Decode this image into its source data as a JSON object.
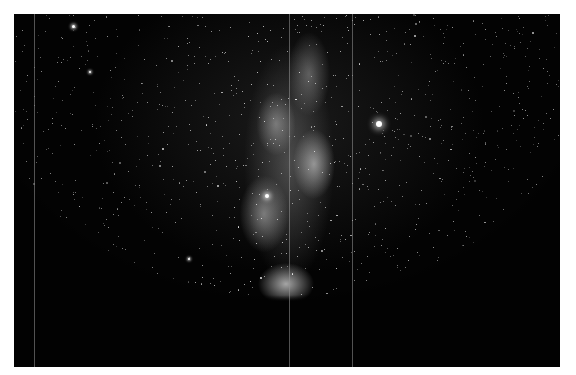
{
  "image": {
    "subject": "Milky Way night sky photograph",
    "colors": {
      "border": "#ffffff",
      "sky": "#030303",
      "galaxy_core": "#dcdcdc",
      "streak": "#969696"
    },
    "streaks_x": [
      20,
      275,
      338
    ],
    "bright_stars": [
      {
        "x": 365,
        "y": 110,
        "r": 3
      },
      {
        "x": 59,
        "y": 12,
        "r": 1.5
      },
      {
        "x": 76,
        "y": 58,
        "r": 1.2
      },
      {
        "x": 253,
        "y": 182,
        "r": 2
      },
      {
        "x": 175,
        "y": 245,
        "r": 1.2
      },
      {
        "x": 480,
        "y": 235,
        "r": 1.2
      },
      {
        "x": 150,
        "y": 290,
        "r": 1
      }
    ]
  }
}
